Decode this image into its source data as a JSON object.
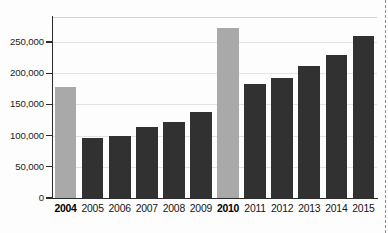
{
  "chart_data": {
    "type": "bar",
    "title": "",
    "subtitle": "",
    "xlabel": "",
    "ylabel": "",
    "categories": [
      "2004",
      "2005",
      "2006",
      "2007",
      "2008",
      "2009",
      "2010",
      "2011",
      "2012",
      "2013",
      "2014",
      "2015"
    ],
    "values": [
      178000,
      96000,
      100000,
      113000,
      122000,
      138000,
      272000,
      182000,
      193000,
      211000,
      229000,
      259000
    ],
    "series": [
      {
        "name": "Value",
        "values": [
          178000,
          96000,
          100000,
          113000,
          122000,
          138000,
          272000,
          182000,
          193000,
          211000,
          229000,
          259000
        ]
      }
    ],
    "highlighted_categories": [
      "2004",
      "2010"
    ],
    "bar_colors": [
      "#a9a9a9",
      "#313131",
      "#313131",
      "#313131",
      "#313131",
      "#313131",
      "#a9a9a9",
      "#313131",
      "#313131",
      "#313131",
      "#313131",
      "#313131"
    ],
    "ylim": [
      0,
      290000
    ],
    "yticks": [
      0,
      50000,
      100000,
      150000,
      200000,
      250000
    ],
    "ytick_labels": [
      "0",
      "50,000",
      "100,000",
      "150,000",
      "200,000",
      "250,000"
    ],
    "grid": true,
    "grid_axis": "y",
    "legend": null,
    "legend_position": "none",
    "annotations": [],
    "colors": {
      "highlight_bar": "#a9a9a9",
      "standard_bar": "#313131",
      "gridline": "#e2e2e2",
      "axis": "#2b2b2b",
      "label_text": "#151515",
      "crop_marker": "#8e8e8e",
      "background": "#fdfdfd"
    }
  }
}
